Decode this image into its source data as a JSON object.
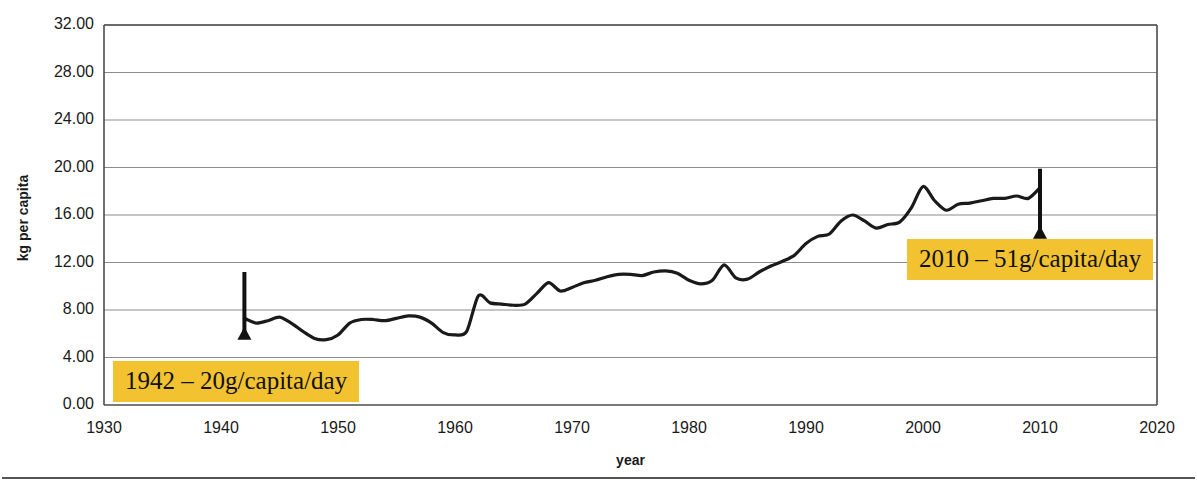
{
  "chart_data": {
    "type": "line",
    "title": "",
    "xlabel": "year",
    "ylabel": "kg per capita",
    "xlim": [
      1930,
      2020
    ],
    "ylim": [
      0,
      32
    ],
    "xticks": [
      1930,
      1940,
      1950,
      1960,
      1970,
      1980,
      1990,
      2000,
      2010,
      2020
    ],
    "yticks": [
      "0.00",
      "4.00",
      "8.00",
      "12.00",
      "16.00",
      "20.00",
      "24.00",
      "28.00",
      "32.00"
    ],
    "grid": "horizontal",
    "legend": "none",
    "line_color": "#1a1a1a",
    "series": [
      {
        "name": "kg per capita",
        "x": [
          1942,
          1943,
          1944,
          1945,
          1946,
          1947,
          1948,
          1949,
          1950,
          1951,
          1952,
          1953,
          1954,
          1955,
          1956,
          1957,
          1958,
          1959,
          1960,
          1961,
          1962,
          1963,
          1964,
          1965,
          1966,
          1967,
          1968,
          1969,
          1970,
          1971,
          1972,
          1973,
          1974,
          1975,
          1976,
          1977,
          1978,
          1979,
          1980,
          1981,
          1982,
          1983,
          1984,
          1985,
          1986,
          1987,
          1988,
          1989,
          1990,
          1991,
          1992,
          1993,
          1994,
          1995,
          1996,
          1997,
          1998,
          1999,
          2000,
          2001,
          2002,
          2003,
          2004,
          2005,
          2006,
          2007,
          2008,
          2009,
          2010
        ],
        "values": [
          7.3,
          6.9,
          7.1,
          7.4,
          6.9,
          6.2,
          5.6,
          5.5,
          5.9,
          6.9,
          7.2,
          7.2,
          7.1,
          7.3,
          7.5,
          7.4,
          6.9,
          6.1,
          5.9,
          6.2,
          9.2,
          8.6,
          8.5,
          8.4,
          8.5,
          9.4,
          10.3,
          9.6,
          9.9,
          10.3,
          10.5,
          10.8,
          11.0,
          11.0,
          10.9,
          11.2,
          11.3,
          11.1,
          10.5,
          10.2,
          10.5,
          11.8,
          10.7,
          10.6,
          11.2,
          11.7,
          12.1,
          12.6,
          13.6,
          14.2,
          14.4,
          15.5,
          16.0,
          15.5,
          14.9,
          15.2,
          15.4,
          16.6,
          18.4,
          17.2,
          16.4,
          16.9,
          17.0,
          17.2,
          17.4,
          17.4,
          17.6,
          17.4,
          18.3
        ]
      }
    ],
    "annotations": [
      {
        "id": "1942",
        "text": "1942 – 20g/capita/day",
        "background": "#f2c230",
        "arrow": {
          "x_year": 1942,
          "points": "up",
          "y_from": 11.2,
          "y_to": 6.6
        }
      },
      {
        "id": "2010",
        "text": "2010 – 51g/capita/day",
        "background": "#f2c230",
        "arrow": {
          "x_year": 2010,
          "points": "up",
          "y_from": 19.9,
          "y_to": 15.1
        }
      }
    ]
  }
}
